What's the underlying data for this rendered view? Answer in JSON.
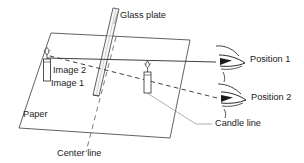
{
  "figure": {
    "background_color": "#ffffff",
    "line_color": "#2b2b2b",
    "faint_line_color": "#8e8e8e",
    "text_color": "#1b1b1b"
  },
  "labels": {
    "glass_plate": "Glass plate",
    "image_2": "Image 2",
    "image_1": "Image 1",
    "paper": "Paper",
    "center_line": "Center line",
    "candle_line": "Candle line",
    "position_1": "Position 1",
    "position_2": "Position 2"
  },
  "objects": {
    "paper_surface": "paper-parallelogram",
    "glass_plate": "glass-plate-panel",
    "left_candle": "image-candle",
    "right_candle": "object-candle",
    "eye_position_1": "eye-icon",
    "eye_position_2": "eye-icon",
    "sight_line_1": "solid-sight-line",
    "sight_line_2": "dashed-sight-line",
    "center_line": "dashed-center-line",
    "candle_leader": "leader-line"
  }
}
